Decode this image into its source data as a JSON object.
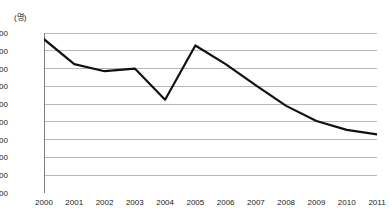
{
  "chart_data": {
    "type": "line",
    "title": "",
    "subtitle": "",
    "unit_label": "(명)",
    "xlabel": "",
    "ylabel": "",
    "categories": [
      "2000",
      "2001",
      "2002",
      "2003",
      "2004",
      "2005",
      "2006",
      "2007",
      "2008",
      "2009",
      "2010",
      "2011"
    ],
    "values": [
      65300,
      62500,
      61700,
      62000,
      58500,
      64600,
      62500,
      60100,
      57800,
      56100,
      55100,
      54600
    ],
    "series": [
      {
        "name": "",
        "values": [
          65300,
          62500,
          61700,
          62000,
          58500,
          64600,
          62500,
          60100,
          57800,
          56100,
          55100,
          54600
        ]
      }
    ],
    "ylim": [
      48000,
      66000
    ],
    "ytick_step": 2000,
    "ytick_labels": [
      "66,000",
      "64,000",
      "62,000",
      "60,000",
      "58,000",
      "56,000",
      "54,000",
      "52,000",
      "50,000",
      "48,000"
    ],
    "ytick_values": [
      66000,
      64000,
      62000,
      60000,
      58000,
      56000,
      54000,
      52000,
      50000,
      48000
    ],
    "xtick_labels": [
      "2000",
      "2001",
      "2002",
      "2003",
      "2004",
      "2005",
      "2006",
      "2007",
      "2008",
      "2009",
      "2010",
      "2011"
    ],
    "grid": true,
    "grid_axis": "y",
    "legend": false,
    "legend_position": "none",
    "colors": {
      "line": "#111111",
      "grid": "#b8b8b8",
      "axis": "#808080",
      "text": "#1a1a1a",
      "background": "#ffffff"
    },
    "line_width": 2.2
  }
}
